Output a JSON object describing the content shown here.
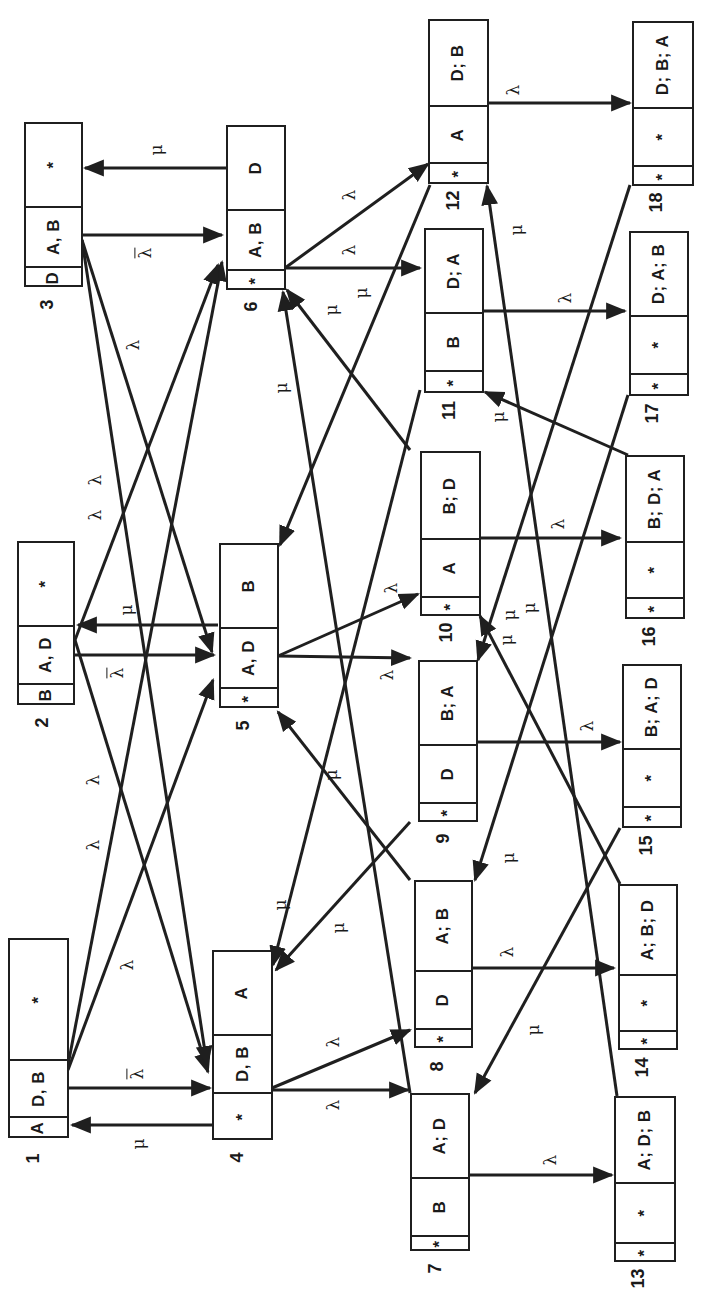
{
  "diagram": {
    "orientation": "rotated-90-ccw",
    "states": [
      {
        "id": "1",
        "cells": [
          "A",
          "D, B",
          "*"
        ]
      },
      {
        "id": "2",
        "cells": [
          "B",
          "A, D",
          "*"
        ]
      },
      {
        "id": "3",
        "cells": [
          "D",
          "A, B",
          "*"
        ]
      },
      {
        "id": "4",
        "cells": [
          "*",
          "D, B",
          "A"
        ]
      },
      {
        "id": "5",
        "cells": [
          "*",
          "A, D",
          "B"
        ]
      },
      {
        "id": "6",
        "cells": [
          "*",
          "A, B",
          "D"
        ]
      },
      {
        "id": "7",
        "cells": [
          "*",
          "B",
          "A; D"
        ]
      },
      {
        "id": "8",
        "cells": [
          "*",
          "D",
          "A; B"
        ]
      },
      {
        "id": "9",
        "cells": [
          "*",
          "D",
          "B; A"
        ]
      },
      {
        "id": "10",
        "cells": [
          "*",
          "A",
          "B; D"
        ]
      },
      {
        "id": "11",
        "cells": [
          "*",
          "B",
          "D; A"
        ]
      },
      {
        "id": "12",
        "cells": [
          "*",
          "A",
          "D; B"
        ]
      },
      {
        "id": "13",
        "cells": [
          "*",
          "*",
          "A; D; B"
        ]
      },
      {
        "id": "14",
        "cells": [
          "*",
          "*",
          "A; B; D"
        ]
      },
      {
        "id": "15",
        "cells": [
          "*",
          "*",
          "B; A; D"
        ]
      },
      {
        "id": "16",
        "cells": [
          "*",
          "*",
          "B; D; A"
        ]
      },
      {
        "id": "17",
        "cells": [
          "*",
          "*",
          "D; A; B"
        ]
      },
      {
        "id": "18",
        "cells": [
          "*",
          "*",
          "D; B; A"
        ]
      }
    ],
    "symbols": {
      "lambda": "λ",
      "lambda_bar": "λ",
      "mu": "μ"
    },
    "transitions": [
      {
        "from": "1",
        "to": "4",
        "label": "λ̄"
      },
      {
        "from": "4",
        "to": "1",
        "label": "μ"
      },
      {
        "from": "2",
        "to": "5",
        "label": "λ̄"
      },
      {
        "from": "5",
        "to": "2",
        "label": "μ"
      },
      {
        "from": "3",
        "to": "6",
        "label": "λ̄"
      },
      {
        "from": "6",
        "to": "3",
        "label": "μ"
      },
      {
        "from": "1",
        "to": "5",
        "label": "λ"
      },
      {
        "from": "1",
        "to": "6",
        "label": "λ"
      },
      {
        "from": "2",
        "to": "4",
        "label": "λ"
      },
      {
        "from": "2",
        "to": "6",
        "label": "λ"
      },
      {
        "from": "3",
        "to": "4",
        "label": "λ"
      },
      {
        "from": "3",
        "to": "5",
        "label": "λ"
      },
      {
        "from": "4",
        "to": "7",
        "label": "λ"
      },
      {
        "from": "4",
        "to": "8",
        "label": "λ"
      },
      {
        "from": "5",
        "to": "9",
        "label": "λ"
      },
      {
        "from": "5",
        "to": "10",
        "label": "λ"
      },
      {
        "from": "6",
        "to": "11",
        "label": "λ"
      },
      {
        "from": "6",
        "to": "12",
        "label": "λ"
      },
      {
        "from": "7",
        "to": "13",
        "label": "λ"
      },
      {
        "from": "8",
        "to": "14",
        "label": "λ"
      },
      {
        "from": "9",
        "to": "15",
        "label": "λ"
      },
      {
        "from": "10",
        "to": "16",
        "label": "λ"
      },
      {
        "from": "11",
        "to": "17",
        "label": "λ"
      },
      {
        "from": "12",
        "to": "18",
        "label": "λ"
      },
      {
        "from": "8",
        "to": "5",
        "label": "μ"
      },
      {
        "from": "7",
        "to": "6",
        "label": "μ"
      },
      {
        "from": "9",
        "to": "4",
        "label": "μ"
      },
      {
        "from": "10",
        "to": "6",
        "label": "μ"
      },
      {
        "from": "11",
        "to": "4",
        "label": "μ"
      },
      {
        "from": "12",
        "to": "5",
        "label": "μ"
      },
      {
        "from": "13",
        "to": "12",
        "label": "μ"
      },
      {
        "from": "14",
        "to": "10",
        "label": "μ"
      },
      {
        "from": "15",
        "to": "7",
        "label": "μ"
      },
      {
        "from": "16",
        "to": "11",
        "label": "μ"
      },
      {
        "from": "17",
        "to": "8",
        "label": "μ"
      },
      {
        "from": "18",
        "to": "9",
        "label": "μ"
      }
    ]
  }
}
